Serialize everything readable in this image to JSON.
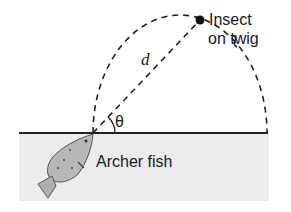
{
  "diagram": {
    "labels": {
      "insect": "Insect",
      "twig": "on twig",
      "distance": "d",
      "angle": "θ",
      "fish": "Archer fish"
    },
    "colors": {
      "line": "#222222",
      "water": "#ececec",
      "fish_body": "#b8b8b8",
      "background": "#ffffff"
    }
  }
}
